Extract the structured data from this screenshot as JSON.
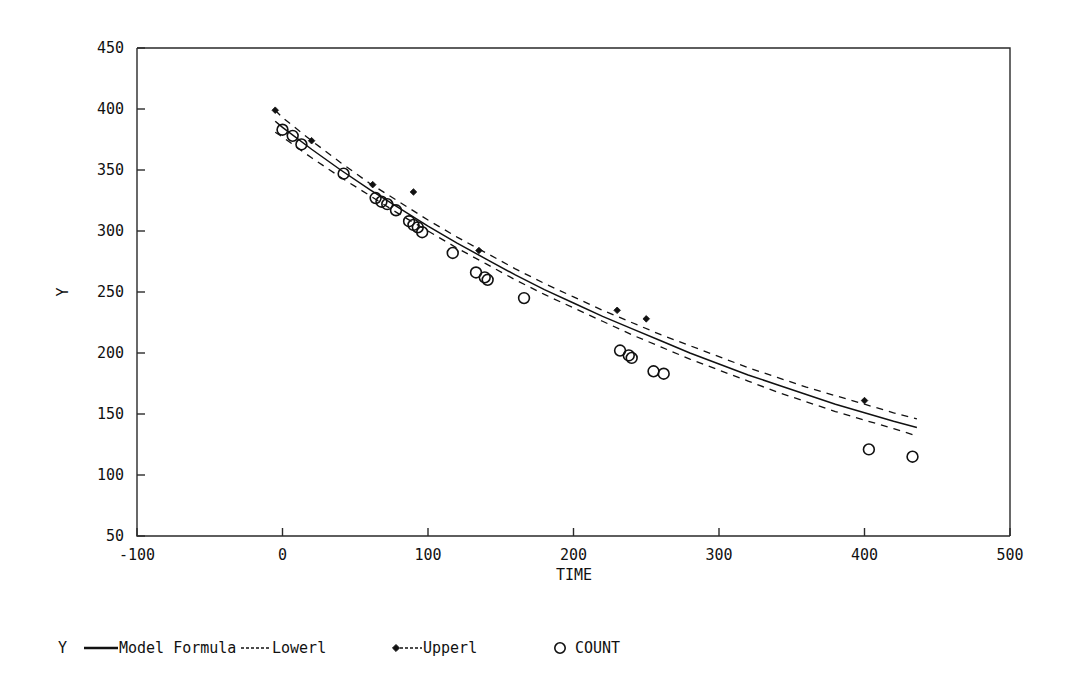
{
  "chart_data": {
    "type": "scatter",
    "title": "",
    "subtitle": "",
    "xlabel": "TIME",
    "ylabel": "Y",
    "xlim": [
      -100,
      500
    ],
    "ylim": [
      50,
      450
    ],
    "xticks": [
      -100,
      0,
      100,
      200,
      300,
      400,
      500
    ],
    "xtick_labels": [
      "-100",
      "0",
      "100",
      "200",
      "300",
      "400",
      "500"
    ],
    "yticks": [
      50,
      100,
      150,
      200,
      250,
      300,
      350,
      400,
      450
    ],
    "ytick_labels": [
      "50",
      "100",
      "150",
      "200",
      "250",
      "300",
      "350",
      "400",
      "450"
    ],
    "grid": false,
    "legend_position": "below-plot",
    "legend": [
      {
        "label": "Model Formula",
        "marker": "none",
        "line": "solid"
      },
      {
        "label": "Lowerl",
        "marker": "none",
        "line": "dashed"
      },
      {
        "label": "Upperl",
        "marker": "diamond",
        "line": "dashed"
      },
      {
        "label": "COUNT",
        "marker": "circle",
        "line": "none"
      }
    ],
    "legend_prefix": "Y",
    "series": [
      {
        "name": "COUNT",
        "type": "scatter",
        "marker": "circle",
        "x": [
          0,
          7,
          13,
          42,
          64,
          68,
          72,
          78,
          87,
          90,
          93,
          96,
          117,
          133,
          139,
          141,
          166,
          232,
          238,
          240,
          255,
          262,
          403,
          433
        ],
        "y": [
          383,
          378,
          371,
          347,
          327,
          324,
          322,
          317,
          308,
          305,
          303,
          299,
          282,
          266,
          262,
          260,
          245,
          202,
          198,
          196,
          185,
          183,
          121,
          115
        ]
      },
      {
        "name": "Model Formula",
        "type": "line",
        "line": "solid",
        "x": [
          -5,
          0,
          20,
          40,
          60,
          80,
          100,
          120,
          140,
          160,
          180,
          200,
          220,
          240,
          260,
          280,
          300,
          320,
          340,
          360,
          380,
          400,
          420,
          436
        ],
        "y": [
          390,
          385,
          367,
          350,
          334,
          319,
          304,
          290,
          277,
          264,
          252,
          241,
          230,
          220,
          210,
          200,
          191,
          182,
          174,
          166,
          158,
          151,
          144,
          139
        ]
      },
      {
        "name": "Lowerl",
        "type": "line",
        "line": "dashed",
        "x": [
          -5,
          0,
          20,
          40,
          60,
          80,
          100,
          120,
          140,
          160,
          180,
          200,
          220,
          240,
          260,
          280,
          300,
          320,
          340,
          360,
          380,
          400,
          420,
          436
        ],
        "y": [
          381,
          377,
          360,
          344,
          329,
          314,
          300,
          286,
          273,
          260,
          248,
          237,
          226,
          215,
          205,
          195,
          186,
          177,
          168,
          160,
          152,
          145,
          138,
          132
        ]
      },
      {
        "name": "Upperl",
        "type": "line",
        "line": "dashed",
        "marker": "diamond",
        "x": [
          -5,
          0,
          20,
          40,
          60,
          80,
          100,
          120,
          140,
          160,
          180,
          200,
          220,
          240,
          260,
          280,
          300,
          320,
          340,
          360,
          380,
          400,
          420,
          436
        ],
        "y": [
          399,
          393,
          374,
          356,
          339,
          324,
          309,
          295,
          282,
          269,
          257,
          246,
          235,
          225,
          215,
          206,
          197,
          188,
          180,
          172,
          165,
          158,
          151,
          146
        ]
      }
    ],
    "upper_markers": {
      "x": [
        -5,
        20,
        62,
        90,
        135,
        230,
        250,
        400
      ],
      "y": [
        399,
        374,
        338,
        332,
        284,
        235,
        228,
        161
      ]
    }
  }
}
